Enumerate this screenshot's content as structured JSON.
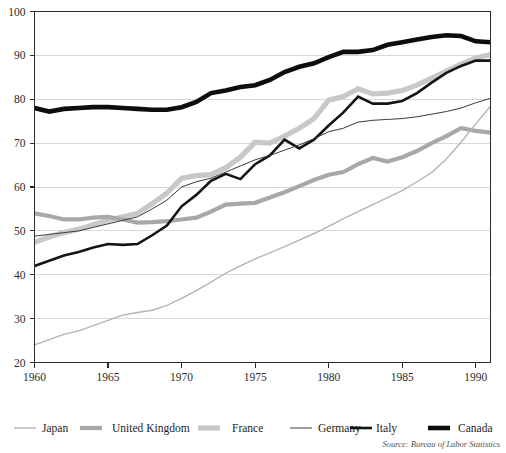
{
  "chart_data": {
    "type": "line",
    "title": "",
    "subtitle": "",
    "xlabel": "",
    "ylabel": "",
    "xlim": [
      1960,
      1991
    ],
    "ylim": [
      20,
      100
    ],
    "grid": true,
    "legend_position": "bottom",
    "source_note": "Source: Bureau of Labor Statistics",
    "x_ticks": [
      1960,
      1965,
      1970,
      1975,
      1980,
      1985,
      1990
    ],
    "x_tick_labels": [
      "1960",
      "1965",
      "1970",
      "1975",
      "1980",
      "1985",
      "1990"
    ],
    "y_ticks": [
      20,
      30,
      40,
      50,
      60,
      70,
      80,
      90,
      100
    ],
    "y_tick_labels": [
      "20",
      "30",
      "40",
      "50",
      "60",
      "70",
      "80",
      "90",
      "100"
    ],
    "x": [
      1960,
      1961,
      1962,
      1963,
      1964,
      1965,
      1966,
      1967,
      1968,
      1969,
      1970,
      1971,
      1972,
      1973,
      1974,
      1975,
      1976,
      1977,
      1978,
      1979,
      1980,
      1981,
      1982,
      1983,
      1984,
      1985,
      1986,
      1987,
      1988,
      1989,
      1990,
      1991
    ],
    "series": [
      {
        "name": "Japan",
        "color": "#b4b4b4",
        "width": 1.4,
        "values": [
          24.0,
          25.2,
          26.4,
          27.2,
          28.4,
          29.6,
          30.8,
          31.4,
          31.9,
          33.0,
          34.6,
          36.4,
          38.3,
          40.4,
          42.0,
          43.6,
          45.0,
          46.4,
          47.9,
          49.4,
          51.0,
          52.8,
          54.4,
          56.0,
          57.6,
          59.2,
          61.2,
          63.3,
          66.4,
          70.2,
          74.4,
          78.4
        ]
      },
      {
        "name": "United Kingdom",
        "color": "#a8a8a8",
        "width": 4.2,
        "values": [
          54.0,
          53.4,
          52.6,
          52.6,
          53.0,
          53.2,
          52.6,
          51.9,
          52.0,
          52.2,
          52.6,
          53.0,
          54.4,
          56.0,
          56.2,
          56.4,
          57.6,
          58.8,
          60.2,
          61.6,
          62.8,
          63.4,
          65.2,
          66.6,
          65.8,
          66.8,
          68.2,
          70.0,
          71.6,
          73.4,
          72.8,
          72.4
        ]
      },
      {
        "name": "France",
        "color": "#c8c8c8",
        "width": 5.2,
        "values": [
          47.4,
          48.6,
          49.6,
          50.4,
          51.4,
          52.4,
          53.2,
          54.0,
          56.2,
          58.6,
          62.0,
          62.6,
          62.8,
          64.4,
          66.8,
          70.2,
          70.0,
          71.6,
          73.4,
          75.6,
          79.8,
          80.6,
          82.4,
          81.2,
          81.4,
          82.0,
          83.2,
          84.8,
          86.4,
          88.0,
          89.4,
          90.2
        ]
      },
      {
        "name": "Germany",
        "color": "#3a3a3a",
        "width": 1.0,
        "values": [
          48.8,
          49.2,
          49.6,
          50.0,
          50.8,
          51.6,
          52.4,
          53.2,
          55.0,
          57.0,
          60.0,
          61.2,
          62.0,
          63.4,
          64.8,
          66.2,
          67.2,
          68.4,
          69.6,
          71.0,
          72.6,
          73.4,
          74.8,
          75.2,
          75.4,
          75.6,
          76.0,
          76.6,
          77.2,
          78.0,
          79.2,
          80.2
        ]
      },
      {
        "name": "Italy",
        "color": "#141414",
        "width": 2.6,
        "values": [
          42.0,
          43.2,
          44.4,
          45.2,
          46.2,
          47.0,
          46.8,
          47.0,
          49.0,
          51.2,
          55.6,
          58.2,
          61.4,
          63.0,
          61.8,
          65.2,
          67.2,
          70.8,
          68.8,
          70.8,
          74.0,
          77.0,
          80.6,
          79.0,
          79.0,
          79.6,
          81.4,
          83.8,
          86.0,
          87.6,
          88.8,
          88.8
        ]
      },
      {
        "name": "Canada",
        "color": "#0d0d0d",
        "width": 4.6,
        "values": [
          78.0,
          77.2,
          77.8,
          78.0,
          78.2,
          78.2,
          78.0,
          77.8,
          77.6,
          77.6,
          78.2,
          79.4,
          81.4,
          82.0,
          82.8,
          83.2,
          84.4,
          86.2,
          87.4,
          88.2,
          89.6,
          90.8,
          90.8,
          91.2,
          92.4,
          93.0,
          93.6,
          94.2,
          94.6,
          94.4,
          93.2,
          93.0
        ]
      }
    ]
  },
  "legend": {
    "items": [
      {
        "label": "Japan"
      },
      {
        "label": "United Kingdom"
      },
      {
        "label": "France"
      },
      {
        "label": "Germany"
      },
      {
        "label": "Italy"
      },
      {
        "label": "Canada"
      }
    ]
  },
  "footer": {
    "source": "Source: Bureau of Labor Statistics"
  }
}
